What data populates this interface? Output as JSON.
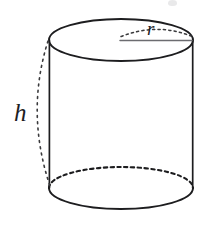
{
  "figure": {
    "kind": "geometry-diagram",
    "shape": "cylinder",
    "background_color": "#ffffff",
    "stroke_color": "#1d1d1f",
    "labels": {
      "height": "h",
      "radius": "r"
    },
    "geometry": {
      "center_x": 121,
      "top_ellipse_center_y": 40,
      "bottom_ellipse_center_y": 188,
      "ellipse_radius_x": 72,
      "ellipse_radius_y": 21,
      "left_side_x": 49,
      "right_side_x": 193,
      "body_height": 148,
      "radius_line_from_x": 121,
      "radius_line_to_x": 193,
      "radius_line_y": 40,
      "height_arc_bulge_x": 26
    },
    "strokes": {
      "top_ellipse": "solid",
      "bottom_ellipse_front": "solid",
      "bottom_ellipse_back": "dashed",
      "side_lines": "solid",
      "radius_line": "solid",
      "radius_arc": "dotted",
      "height_arc": "dotted"
    }
  }
}
